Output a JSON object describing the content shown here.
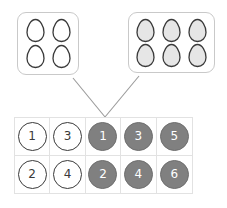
{
  "canvas": {
    "width": 227,
    "height": 208,
    "background": "#ffffff"
  },
  "colors": {
    "box_border": "#c9c9c9",
    "egg_outline": "#3a3a3a",
    "egg_white_fill": "#ffffff",
    "egg_gray_fill": "#e6e6e6",
    "grid_line": "#e2e2e2",
    "token_white_fill": "#ffffff",
    "token_white_border": "#3a3a3a",
    "token_white_text": "#3a3a3a",
    "token_gray_fill": "#808080",
    "token_gray_border": "#6e6e6e",
    "token_gray_text": "#ffffff",
    "connector_line": "#9a9a9a"
  },
  "egg_boxes": [
    {
      "id": "left",
      "name": "egg-carton-left",
      "egg_count": 4,
      "columns": 2,
      "rows": 2,
      "egg_fill": "#ffffff",
      "egg_style": "outline",
      "eggs": [
        "egg",
        "egg",
        "egg",
        "egg"
      ]
    },
    {
      "id": "right",
      "name": "egg-carton-right",
      "egg_count": 6,
      "columns": 3,
      "rows": 2,
      "egg_fill": "#e6e6e6",
      "egg_style": "filled",
      "eggs": [
        "egg",
        "egg",
        "egg",
        "egg",
        "egg",
        "egg"
      ]
    }
  ],
  "connectors": [
    {
      "name": "connector-left-carton",
      "from": [
        73,
        78
      ],
      "to": [
        105,
        117
      ]
    },
    {
      "name": "connector-right-carton",
      "from": [
        139,
        76
      ],
      "to": [
        105,
        117
      ]
    }
  ],
  "number_grid": {
    "columns": 5,
    "rows": 2,
    "cells": [
      [
        {
          "value": "1",
          "style": "white"
        },
        {
          "value": "3",
          "style": "white"
        },
        {
          "value": "1",
          "style": "gray"
        },
        {
          "value": "3",
          "style": "gray"
        },
        {
          "value": "5",
          "style": "gray"
        }
      ],
      [
        {
          "value": "2",
          "style": "white"
        },
        {
          "value": "4",
          "style": "white"
        },
        {
          "value": "2",
          "style": "gray"
        },
        {
          "value": "4",
          "style": "gray"
        },
        {
          "value": "6",
          "style": "gray"
        }
      ]
    ]
  }
}
